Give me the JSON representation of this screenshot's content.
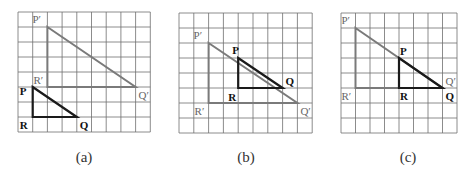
{
  "figure": {
    "colors": {
      "grid": "#6e6e6e",
      "image_triangle": "#7a7a7a",
      "object_triangle": "#1a1a1a",
      "image_label": "#666666",
      "object_label": "#111111"
    },
    "panels": [
      {
        "id": "a",
        "caption": "(a)",
        "caption_pos": [
          84,
          163
        ],
        "origin": [
          18,
          12
        ],
        "cell": [
          14.7,
          15
        ],
        "cols": 9,
        "rows": 8,
        "image_triangle": {
          "P": {
            "label": "P′",
            "pt": [
              2,
              1
            ],
            "offset": [
              -15,
              -4
            ]
          },
          "Q": {
            "label": "Q′",
            "pt": [
              8,
              5
            ],
            "offset": [
              3,
              12
            ]
          },
          "R": {
            "label": "R′",
            "pt": [
              2,
              5
            ],
            "offset": [
              -14,
              -3
            ]
          }
        },
        "object_triangle": {
          "P": {
            "label": "P",
            "pt": [
              1,
              5
            ],
            "offset": [
              -13,
              8
            ]
          },
          "Q": {
            "label": "Q",
            "pt": [
              4,
              7
            ],
            "offset": [
              3,
              12
            ]
          },
          "R": {
            "label": "R",
            "pt": [
              1,
              7
            ],
            "offset": [
              -13,
              12
            ]
          }
        }
      },
      {
        "id": "b",
        "caption": "(b)",
        "caption_pos": [
          246,
          163
        ],
        "origin": [
          179,
          13
        ],
        "cell": [
          14.8,
          15
        ],
        "cols": 9,
        "rows": 8,
        "image_triangle": {
          "P": {
            "label": "P′",
            "pt": [
              2,
              2
            ],
            "offset": [
              -15,
              -4
            ]
          },
          "Q": {
            "label": "Q′",
            "pt": [
              8,
              6
            ],
            "offset": [
              3,
              12
            ]
          },
          "R": {
            "label": "R′",
            "pt": [
              2,
              6
            ],
            "offset": [
              -14,
              12
            ]
          }
        },
        "object_triangle": {
          "P": {
            "label": "P",
            "pt": [
              4,
              3
            ],
            "offset": [
              -6,
              -4
            ]
          },
          "Q": {
            "label": "Q",
            "pt": [
              7,
              5
            ],
            "offset": [
              3,
              -3
            ]
          },
          "R": {
            "label": "R",
            "pt": [
              4,
              5
            ],
            "offset": [
              -10,
              13
            ]
          }
        }
      },
      {
        "id": "c",
        "caption": "(c)",
        "caption_pos": [
          408,
          163
        ],
        "origin": [
          341,
          13
        ],
        "cell": [
          14.5,
          15
        ],
        "cols": 8,
        "rows": 8,
        "image_triangle": {
          "P": {
            "label": "P′",
            "pt": [
              1,
              1
            ],
            "offset": [
              -14,
              -4
            ]
          },
          "Q": {
            "label": "Q′",
            "pt": [
              7,
              5
            ],
            "offset": [
              3,
              -3
            ]
          },
          "R": {
            "label": "R′",
            "pt": [
              1,
              5
            ],
            "offset": [
              -14,
              12
            ]
          }
        },
        "object_triangle": {
          "P": {
            "label": "P",
            "pt": [
              4,
              3
            ],
            "offset": [
              1,
              -3
            ]
          },
          "Q": {
            "label": "Q",
            "pt": [
              7,
              5
            ],
            "offset": [
              3,
              12
            ]
          },
          "R": {
            "label": "R",
            "pt": [
              4,
              5
            ],
            "offset": [
              1,
              12
            ]
          }
        }
      }
    ]
  }
}
